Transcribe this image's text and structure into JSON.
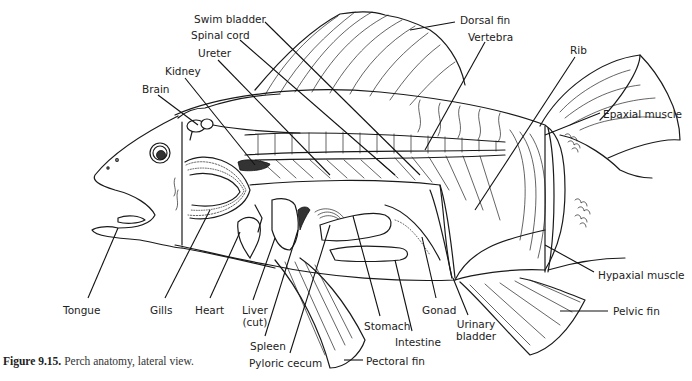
{
  "figure": {
    "caption_number": "Figure 9.15.",
    "caption_text": "Perch anatomy, lateral view.",
    "subject": "Perch",
    "view": "lateral"
  },
  "labels": [
    {
      "id": "swim-bladder",
      "text": "Swim bladder",
      "x": 194,
      "y": 13,
      "lead": [
        [
          265,
          22
        ],
        [
          420,
          175
        ]
      ]
    },
    {
      "id": "spinal-cord",
      "text": "Spinal cord",
      "x": 191,
      "y": 29,
      "lead": [
        [
          240,
          40
        ],
        [
          395,
          175
        ]
      ]
    },
    {
      "id": "ureter",
      "text": "Ureter",
      "x": 198,
      "y": 47,
      "lead": [
        [
          218,
          60
        ],
        [
          330,
          175
        ]
      ]
    },
    {
      "id": "kidney",
      "text": "Kidney",
      "x": 165,
      "y": 65,
      "lead": [
        [
          185,
          78
        ],
        [
          255,
          165
        ]
      ]
    },
    {
      "id": "brain",
      "text": "Brain",
      "x": 142,
      "y": 83,
      "lead": [
        [
          158,
          95
        ],
        [
          198,
          125
        ]
      ]
    },
    {
      "id": "dorsal-fin",
      "text": "Dorsal fin",
      "x": 460,
      "y": 14,
      "lead": [
        [
          455,
          22
        ],
        [
          410,
          30
        ]
      ]
    },
    {
      "id": "vertebra",
      "text": "Vertebra",
      "x": 468,
      "y": 31,
      "lead": [
        [
          485,
          42
        ],
        [
          425,
          150
        ]
      ]
    },
    {
      "id": "rib",
      "text": "Rib",
      "x": 570,
      "y": 44,
      "lead": [
        [
          575,
          57
        ],
        [
          475,
          210
        ]
      ]
    },
    {
      "id": "epaxial-muscle",
      "text": "Epaxial muscle",
      "x": 603,
      "y": 108,
      "lead": [
        [
          600,
          113
        ],
        [
          545,
          135
        ]
      ]
    },
    {
      "id": "hypaxial-muscle",
      "text": "Hypaxial muscle",
      "x": 598,
      "y": 269,
      "lead": [
        [
          594,
          272
        ],
        [
          545,
          245
        ]
      ]
    },
    {
      "id": "pelvic-fin",
      "text": "Pelvic fin",
      "x": 613,
      "y": 305,
      "lead": [
        [
          608,
          311
        ],
        [
          560,
          311
        ]
      ]
    },
    {
      "id": "tongue",
      "text": "Tongue",
      "x": 63,
      "y": 304,
      "lead": [
        [
          88,
          298
        ],
        [
          118,
          228
        ]
      ]
    },
    {
      "id": "gills",
      "text": "Gills",
      "x": 150,
      "y": 304,
      "lead": [
        [
          165,
          298
        ],
        [
          210,
          210
        ]
      ]
    },
    {
      "id": "heart",
      "text": "Heart",
      "x": 195,
      "y": 304,
      "lead": [
        [
          210,
          298
        ],
        [
          240,
          232
        ]
      ]
    },
    {
      "id": "liver-cut",
      "text": "Liver\n(cut)",
      "x": 242,
      "y": 304,
      "lead": [
        [
          253,
          300
        ],
        [
          275,
          238
        ]
      ]
    },
    {
      "id": "spleen",
      "text": "Spleen",
      "x": 250,
      "y": 340,
      "lead": [
        [
          265,
          336
        ],
        [
          298,
          230
        ]
      ]
    },
    {
      "id": "pyloric-cecum",
      "text": "Pyloric cecum",
      "x": 249,
      "y": 357,
      "lead": [
        [
          290,
          353
        ],
        [
          330,
          225
        ]
      ]
    },
    {
      "id": "pectoral-fin",
      "text": "Pectoral fin",
      "x": 366,
      "y": 355,
      "lead": [
        [
          363,
          360
        ],
        [
          344,
          360
        ]
      ]
    },
    {
      "id": "stomach",
      "text": "Stomach",
      "x": 364,
      "y": 320,
      "lead": [
        [
          380,
          316
        ],
        [
          353,
          216
        ]
      ]
    },
    {
      "id": "intestine",
      "text": "Intestine",
      "x": 395,
      "y": 336,
      "lead": [
        [
          412,
          331
        ],
        [
          395,
          260
        ]
      ]
    },
    {
      "id": "gonad",
      "text": "Gonad",
      "x": 422,
      "y": 304,
      "lead": [
        [
          436,
          298
        ],
        [
          422,
          237
        ]
      ]
    },
    {
      "id": "urinary-bladder",
      "text": "Urinary\nbladder",
      "x": 456,
      "y": 318,
      "lead": [
        [
          468,
          315
        ],
        [
          453,
          278
        ]
      ]
    }
  ],
  "colors": {
    "line": "#1a1a1a",
    "text": "#222222",
    "background": "#ffffff"
  }
}
